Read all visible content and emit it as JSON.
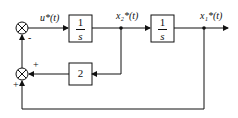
{
  "diagram": {
    "type": "block-diagram",
    "signals": {
      "u": "u*(t)",
      "x2": "x₂*(t)",
      "x1": "x₁*(t)"
    },
    "blocks": {
      "integrator1": {
        "num": "1",
        "den": "s"
      },
      "integrator2": {
        "num": "1",
        "den": "s"
      },
      "gain": "2"
    },
    "summers": {
      "top": {
        "signs": [
          "-"
        ]
      },
      "bottom": {
        "signs": [
          "+",
          "+"
        ]
      }
    }
  }
}
